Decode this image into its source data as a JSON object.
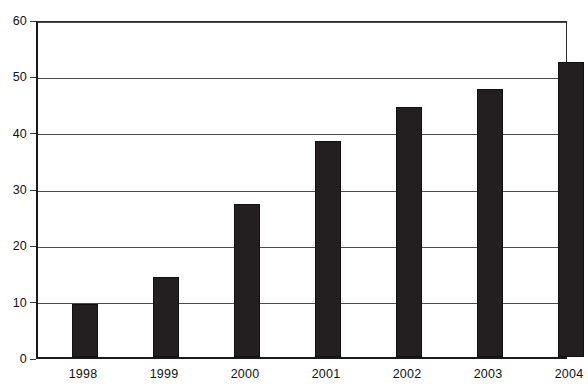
{
  "chart_data": {
    "type": "bar",
    "title": "",
    "subtitle": "",
    "xlabel": "",
    "ylabel": "",
    "categories": [
      "1998",
      "1999",
      "2000",
      "2001",
      "2002",
      "2003",
      "2004"
    ],
    "values": [
      9.4,
      14.2,
      27.2,
      38.3,
      44.3,
      47.5,
      52.3
    ],
    "series": [
      {
        "name": "",
        "values": [
          9.4,
          14.2,
          27.2,
          38.3,
          44.3,
          47.5,
          52.3
        ]
      }
    ],
    "ylim": [
      0,
      60
    ],
    "y_ticks": [
      0,
      10,
      20,
      30,
      40,
      50,
      60
    ],
    "y_tick_labels": [
      "0",
      "10",
      "20",
      "30",
      "40",
      "50",
      "60"
    ],
    "x_tick_labels": [
      "1998",
      "1999",
      "2000",
      "2001",
      "2002",
      "2003",
      "2004"
    ],
    "grid": true,
    "grid_axis": "y",
    "legend": false,
    "legend_position": "none",
    "bar_color": "#231f20",
    "grid_color": "#4d4d4d",
    "axis_color": "#1a1a1a",
    "background_color": "#ffffff",
    "annotations": []
  }
}
